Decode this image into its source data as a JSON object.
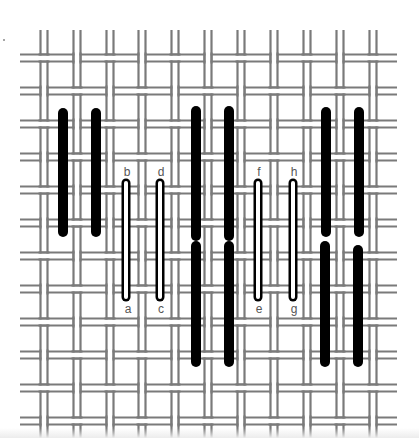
{
  "figure": {
    "title": "",
    "colors": {
      "thread": "#7a7a7a",
      "background": "#ffffff",
      "stitch_solid": "#000000",
      "stitch_outline_fill": "#ffffff"
    }
  },
  "grid": {
    "vertical_pairs_x": [
      44,
      77,
      110,
      142,
      175,
      208,
      241,
      274,
      307,
      340,
      373
    ],
    "horizontal_pairs_y": [
      58,
      91,
      124,
      157,
      190,
      223,
      256,
      289,
      322,
      355,
      388,
      421
    ],
    "pair_gap": 7,
    "h_extent": [
      20,
      397
    ],
    "v_extent": [
      30,
      438
    ]
  },
  "stitches": {
    "solid": [
      {
        "x": 63,
        "y1": 113,
        "y2": 232
      },
      {
        "x": 96,
        "y1": 113,
        "y2": 232
      },
      {
        "x": 196,
        "y1": 111,
        "y2": 236
      },
      {
        "x": 229,
        "y1": 111,
        "y2": 236
      },
      {
        "x": 196,
        "y1": 246,
        "y2": 362
      },
      {
        "x": 229,
        "y1": 246,
        "y2": 362
      },
      {
        "x": 326,
        "y1": 112,
        "y2": 232
      },
      {
        "x": 359,
        "y1": 112,
        "y2": 232
      },
      {
        "x": 325,
        "y1": 246,
        "y2": 362
      },
      {
        "x": 358,
        "y1": 250,
        "y2": 362
      }
    ],
    "outlined": [
      {
        "x": 126,
        "y1": 183,
        "y2": 297,
        "top_label": "b",
        "bottom_label": "a"
      },
      {
        "x": 160,
        "y1": 183,
        "y2": 297,
        "top_label": "d",
        "bottom_label": "c"
      },
      {
        "x": 258,
        "y1": 183,
        "y2": 297,
        "top_label": "f",
        "bottom_label": "e"
      },
      {
        "x": 293,
        "y1": 183,
        "y2": 297,
        "top_label": "h",
        "bottom_label": "g"
      }
    ]
  },
  "labels": [
    {
      "text": "b",
      "x": 127,
      "y": 172
    },
    {
      "text": "a",
      "x": 128,
      "y": 309
    },
    {
      "text": "d",
      "x": 161,
      "y": 172
    },
    {
      "text": "c",
      "x": 161,
      "y": 309
    },
    {
      "text": "f",
      "x": 259,
      "y": 172
    },
    {
      "text": "e",
      "x": 259,
      "y": 309
    },
    {
      "text": "h",
      "x": 294,
      "y": 172
    },
    {
      "text": "g",
      "x": 294,
      "y": 309
    }
  ]
}
